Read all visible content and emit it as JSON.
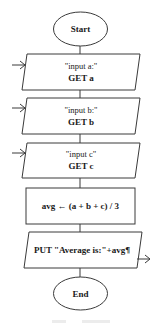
{
  "flowchart": {
    "start": {
      "label": "Start"
    },
    "input_a": {
      "prompt": "\"input a:\"",
      "action": "GET a"
    },
    "input_b": {
      "prompt": "\"input b:\"",
      "action": "GET b"
    },
    "input_c": {
      "prompt": "\"input c\"",
      "action": "GET c"
    },
    "process": {
      "label": "avg ← (a + b + c) / 3"
    },
    "output": {
      "label": "PUT \"Average is:\"+avg¶"
    },
    "end": {
      "label": "End"
    }
  },
  "colors": {
    "stroke": "#3a3a3a",
    "text": "#1a1a1a",
    "background": "#ffffff"
  }
}
